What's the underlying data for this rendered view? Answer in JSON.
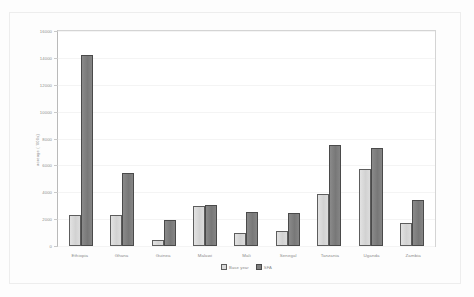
{
  "chart_data": {
    "type": "bar",
    "title": "",
    "xlabel": "",
    "ylabel": "acreage ( '000s)",
    "ylim": [
      0,
      16000
    ],
    "yticks": [
      0,
      2000,
      4000,
      6000,
      8000,
      10000,
      12000,
      14000,
      16000
    ],
    "ytick_labels": [
      "0",
      "2000",
      "4000",
      "6000",
      "8000",
      "10000",
      "12000",
      "14000",
      "16000"
    ],
    "grid": false,
    "legend_position": "bottom",
    "categories": [
      "Ethiopia",
      "Ghana",
      "Guinea",
      "Malawi",
      "Mali",
      "Senegal",
      "Tanzania",
      "Uganda",
      "Zambia"
    ],
    "series": [
      {
        "name": "Base year",
        "color": "#d9d9d9",
        "values": [
          2300,
          2300,
          450,
          3000,
          950,
          1100,
          3900,
          5700,
          1700
        ]
      },
      {
        "name": "SFA",
        "color": "#7f7f7f",
        "values": [
          14200,
          5400,
          1950,
          3050,
          2500,
          2450,
          7500,
          7300,
          3400
        ]
      }
    ]
  },
  "axis": {
    "y_title": "acreage ( '000s)"
  },
  "legend": {
    "items": [
      {
        "label": "Base year",
        "swatch": "light-gray-swatch"
      },
      {
        "label": "SFA",
        "swatch": "dark-gray-swatch"
      }
    ]
  }
}
